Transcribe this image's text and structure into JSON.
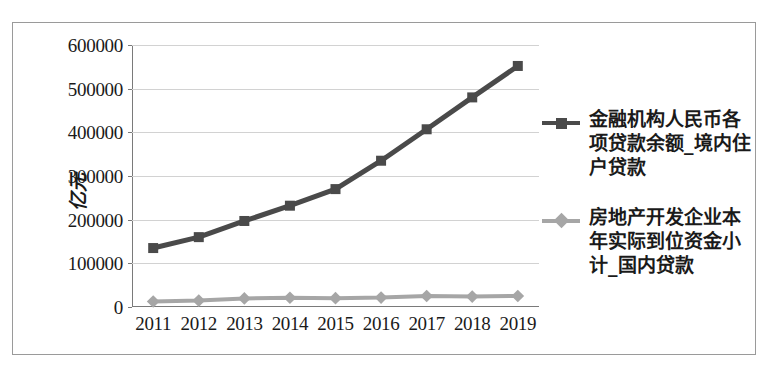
{
  "chart_data": {
    "type": "line",
    "title": "",
    "xlabel": "",
    "ylabel": "亿元",
    "categories": [
      "2011",
      "2012",
      "2013",
      "2014",
      "2015",
      "2016",
      "2017",
      "2018",
      "2019"
    ],
    "ylim": [
      0,
      600000
    ],
    "ytick_labels": [
      "600000",
      "500000",
      "400000",
      "300000",
      "200000",
      "100000",
      "0"
    ],
    "yticks": [
      600000,
      500000,
      400000,
      300000,
      200000,
      100000,
      0
    ],
    "grid": true,
    "legend_position": "right",
    "series": [
      {
        "name": "金融机构人民币各项贷款余额_境内住户贷款",
        "color": "#4a4a4a",
        "marker": "square",
        "values": [
          135000,
          160000,
          197000,
          232000,
          270000,
          335000,
          407000,
          480000,
          552000
        ]
      },
      {
        "name": "房地产开发企业本年实际到位资金小计_国内贷款",
        "color": "#a6a6a6",
        "marker": "diamond",
        "values": [
          12600,
          14800,
          19700,
          21200,
          20200,
          21500,
          25200,
          24000,
          25200
        ]
      }
    ]
  },
  "legend": {
    "entries": [
      {
        "label": "金融机构人民币各项贷款余额_境内住户贷款",
        "marker": "square-marker",
        "color": "#4a4a4a"
      },
      {
        "label": "房地产开发企业本年实际到位资金小计_国内贷款",
        "marker": "diamond-marker",
        "color": "#a6a6a6"
      }
    ]
  },
  "axis": {
    "y_title": "亿元"
  }
}
